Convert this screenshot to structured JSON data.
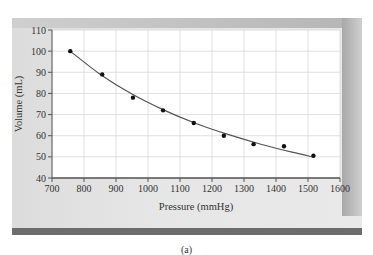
{
  "chart_data": {
    "type": "scatter",
    "title": "",
    "xlabel": "Pressure (mmHg)",
    "ylabel": "Volume (mL)",
    "xlim": [
      700,
      1600
    ],
    "ylim": [
      40,
      110
    ],
    "x_ticks": [
      700,
      800,
      900,
      1000,
      1100,
      1200,
      1300,
      1400,
      1500,
      1600
    ],
    "y_ticks": [
      40,
      50,
      60,
      70,
      80,
      90,
      100,
      110
    ],
    "grid": true,
    "legend": null,
    "series": [
      {
        "name": "Measured data",
        "style": "points",
        "x": [
          757,
          857,
          953,
          1047,
          1143,
          1237,
          1330,
          1425,
          1517
        ],
        "y": [
          100,
          89,
          78,
          72,
          66,
          60,
          56,
          55,
          50.5
        ]
      },
      {
        "name": "Fitted curve",
        "style": "line",
        "x": [
          757,
          850,
          950,
          1050,
          1150,
          1250,
          1350,
          1450,
          1517
        ],
        "y": [
          100,
          89.1,
          79.7,
          72.1,
          65.8,
          60.6,
          56.1,
          52.2,
          49.9
        ]
      }
    ],
    "annotations": [
      "(a)"
    ]
  },
  "caption": "(a)"
}
